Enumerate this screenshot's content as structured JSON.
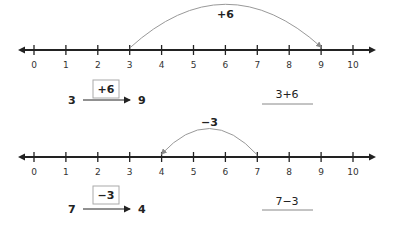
{
  "lines": [
    {
      "ticks": [
        "0",
        "1",
        "2",
        "3",
        "4",
        "5",
        "6",
        "7",
        "8",
        "9",
        "10"
      ],
      "jump": {
        "from": 3,
        "to": 9,
        "label": "+6"
      },
      "mapping": {
        "start": "3",
        "operation": "+6",
        "end": "9"
      },
      "expression": "3+6"
    },
    {
      "ticks": [
        "0",
        "1",
        "2",
        "3",
        "4",
        "5",
        "6",
        "7",
        "8",
        "9",
        "10"
      ],
      "jump": {
        "from": 7,
        "to": 4,
        "label": "−3"
      },
      "mapping": {
        "start": "7",
        "operation": "−3",
        "end": "4"
      },
      "expression": "7−3"
    }
  ]
}
